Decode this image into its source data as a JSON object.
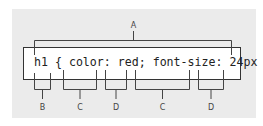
{
  "diagram": {
    "code": "h1 { color: red; font-size: 24px }",
    "top_label": {
      "text": "A",
      "meaning": "rule"
    },
    "bottom_labels": [
      {
        "text": "B",
        "target": "h1"
      },
      {
        "text": "C",
        "target": "color"
      },
      {
        "text": "D",
        "target": "red"
      },
      {
        "text": "C",
        "target": "font-size"
      },
      {
        "text": "D",
        "target": "24px"
      }
    ]
  },
  "colors": {
    "panel": "#ebebeb",
    "box_border": "#333333",
    "line": "#444444",
    "text": "#222222"
  }
}
